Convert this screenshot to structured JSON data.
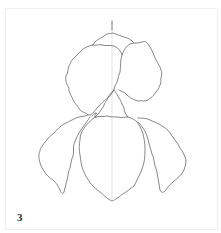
{
  "illustration": {
    "subject": "iris flower line drawing",
    "step_number": "3",
    "colors": {
      "stroke": "#6a6a6a",
      "guide": "#cfcfcf",
      "background": "#ffffff",
      "frame": "#f0f0f0"
    }
  }
}
